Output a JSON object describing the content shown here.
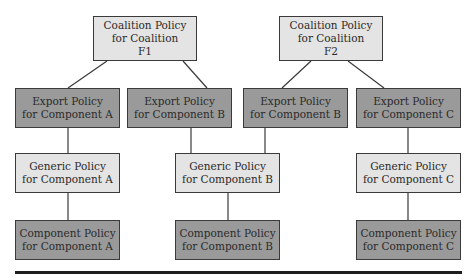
{
  "diagram": {
    "type": "hierarchy",
    "colors": {
      "light_box": "#e4e4e4",
      "dark_box": "#9a9a9a",
      "border": "#3a3a3a",
      "line": "#3a3a3a"
    },
    "nodes": [
      {
        "id": "coal_f1",
        "label": "Coalition Policy\nfor Coalition\nF1",
        "shade": "light",
        "x": 93,
        "y": 16,
        "w": 104,
        "h": 45
      },
      {
        "id": "coal_f2",
        "label": "Coalition Policy\nfor Coalition\nF2",
        "shade": "light",
        "x": 279,
        "y": 16,
        "w": 104,
        "h": 45
      },
      {
        "id": "exp_a",
        "label": "Export Policy\nfor Component A",
        "shade": "dark",
        "x": 15,
        "y": 88,
        "w": 105,
        "h": 40
      },
      {
        "id": "exp_b1",
        "label": "Export Policy\nfor Component B",
        "shade": "dark",
        "x": 127,
        "y": 88,
        "w": 105,
        "h": 40
      },
      {
        "id": "exp_b2",
        "label": "Export Policy\nfor Component B",
        "shade": "dark",
        "x": 243,
        "y": 88,
        "w": 105,
        "h": 40
      },
      {
        "id": "exp_c",
        "label": "Export Policy\nfor Component C",
        "shade": "dark",
        "x": 356,
        "y": 88,
        "w": 105,
        "h": 40
      },
      {
        "id": "gen_a",
        "label": "Generic Policy\nfor Component A",
        "shade": "light",
        "x": 15,
        "y": 153,
        "w": 105,
        "h": 40
      },
      {
        "id": "gen_b",
        "label": "Generic Policy\nfor Component B",
        "shade": "light",
        "x": 175,
        "y": 153,
        "w": 105,
        "h": 40
      },
      {
        "id": "gen_c",
        "label": "Generic Policy\nfor Component C",
        "shade": "light",
        "x": 356,
        "y": 153,
        "w": 105,
        "h": 40
      },
      {
        "id": "comp_a",
        "label": "Component Policy\nfor Component A",
        "shade": "dark",
        "x": 15,
        "y": 220,
        "w": 105,
        "h": 40
      },
      {
        "id": "comp_b",
        "label": "Component Policy\nfor Component B",
        "shade": "dark",
        "x": 175,
        "y": 220,
        "w": 105,
        "h": 40
      },
      {
        "id": "comp_c",
        "label": "Component Policy\nfor Component C",
        "shade": "dark",
        "x": 356,
        "y": 220,
        "w": 105,
        "h": 40
      }
    ],
    "edges": [
      {
        "from": "coal_f1",
        "to": "exp_a",
        "x1": 107,
        "y1": 61,
        "x2": 68,
        "y2": 88
      },
      {
        "from": "coal_f1",
        "to": "exp_b1",
        "x1": 183,
        "y1": 61,
        "x2": 207,
        "y2": 88
      },
      {
        "from": "coal_f2",
        "to": "exp_b2",
        "x1": 311,
        "y1": 61,
        "x2": 282,
        "y2": 88
      },
      {
        "from": "coal_f2",
        "to": "exp_c",
        "x1": 348,
        "y1": 61,
        "x2": 384,
        "y2": 88
      },
      {
        "from": "exp_a",
        "to": "gen_a",
        "x1": 68,
        "y1": 128,
        "x2": 68,
        "y2": 153
      },
      {
        "from": "exp_b1",
        "to": "gen_b",
        "x1": 191,
        "y1": 128,
        "x2": 191,
        "y2": 153
      },
      {
        "from": "exp_b2",
        "to": "gen_b",
        "x1": 265,
        "y1": 128,
        "x2": 265,
        "y2": 153
      },
      {
        "from": "exp_c",
        "to": "gen_c",
        "x1": 408,
        "y1": 128,
        "x2": 408,
        "y2": 153
      },
      {
        "from": "gen_a",
        "to": "comp_a",
        "x1": 68,
        "y1": 193,
        "x2": 68,
        "y2": 220
      },
      {
        "from": "gen_b",
        "to": "comp_b",
        "x1": 228,
        "y1": 193,
        "x2": 228,
        "y2": 220
      },
      {
        "from": "gen_c",
        "to": "comp_c",
        "x1": 408,
        "y1": 193,
        "x2": 408,
        "y2": 220
      }
    ]
  }
}
